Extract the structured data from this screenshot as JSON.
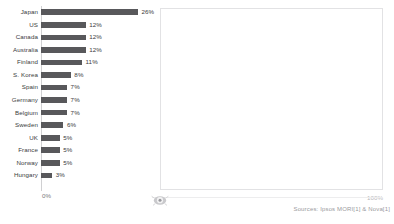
{
  "chart_data": {
    "type": "bar",
    "orientation": "horizontal",
    "title": "",
    "xlabel": "",
    "ylabel": "",
    "xlim": [
      0,
      100
    ],
    "grid": false,
    "legend": null,
    "bar_color": "#58585b",
    "categories": [
      "Japan",
      "US",
      "Canada",
      "Australia",
      "Finland",
      "S. Korea",
      "Spain",
      "Germany",
      "Belgium",
      "Sweden",
      "UK",
      "France",
      "Norway",
      "Hungary"
    ],
    "values": [
      26,
      12,
      12,
      12,
      11,
      8,
      7,
      7,
      7,
      6,
      5,
      5,
      5,
      3
    ],
    "value_labels": [
      "26%",
      "12%",
      "12%",
      "12%",
      "11%",
      "8%",
      "7%",
      "7%",
      "7%",
      "6%",
      "5%",
      "5%",
      "5%",
      "3%"
    ],
    "axis_tick_labels": [
      "0%",
      "100%"
    ]
  },
  "axis": {
    "zero_label": "0%",
    "hundred_label": "100%"
  },
  "footer": {
    "source_text": "Sources: Ipsos MORI[1] & Nova[1]"
  },
  "icons": {
    "center": "circle-target-icon"
  }
}
